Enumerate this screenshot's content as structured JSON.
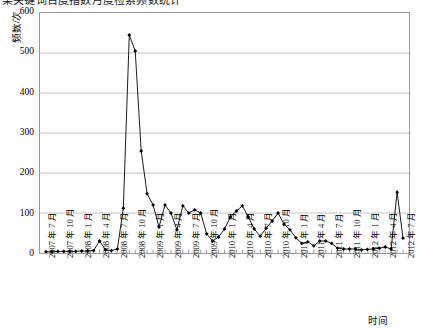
{
  "title": {
    "text": "某关键词百度指数月度检索频数统计",
    "cut_off": true,
    "legend_marker": "legend-swatch"
  },
  "axes": {
    "y_title": "频数/次",
    "x_title": "时间",
    "y_ticks": [
      600,
      500,
      400,
      300,
      200,
      100,
      0
    ],
    "y_min": 0,
    "y_max": 600,
    "x_tick_labels": [
      "2007 年 7 月",
      "2007 年 10 月",
      "2008 年 1 月",
      "2008 年 4 月",
      "2008 年 7 月",
      "2008 年 10 月",
      "2009 年 1 月",
      "2009 年 4 月",
      "2009 年 7 月",
      "2009 年 10 月",
      "2010 年 1 月",
      "2010 年 4 月",
      "2010 年 7 月",
      "2010 年 10 月",
      "2011 年 1 月",
      "2011 年 4 月",
      "2011 年 7 月",
      "2011 年 10 月",
      "2012 年 1 月",
      "2012 年 4 月",
      "2012 年 7 月"
    ]
  },
  "style": {
    "line_color": "#000000",
    "marker_color": "#000000",
    "grid_color": "#b3b3b3",
    "border_color": "#9a9a9a",
    "plot_background": "#ffffff"
  },
  "chart_data": {
    "type": "line",
    "title": "某关键词百度指数月度检索频数统计",
    "xlabel": "时间",
    "ylabel": "频数/次",
    "ylim": [
      0,
      600
    ],
    "grid": true,
    "legend": null,
    "marker": "diamond",
    "x_tick_interval_months": 3,
    "x": [
      "2007-07",
      "2007-08",
      "2007-09",
      "2007-10",
      "2007-11",
      "2007-12",
      "2008-01",
      "2008-02",
      "2008-03",
      "2008-04",
      "2008-05",
      "2008-06",
      "2008-07",
      "2008-08",
      "2008-09",
      "2008-10",
      "2008-11",
      "2008-12",
      "2009-01",
      "2009-02",
      "2009-03",
      "2009-04",
      "2009-05",
      "2009-06",
      "2009-07",
      "2009-08",
      "2009-09",
      "2009-10",
      "2009-11",
      "2009-12",
      "2010-01",
      "2010-02",
      "2010-03",
      "2010-04",
      "2010-05",
      "2010-06",
      "2010-07",
      "2010-08",
      "2010-09",
      "2010-10",
      "2010-11",
      "2010-12",
      "2011-01",
      "2011-02",
      "2011-03",
      "2011-04",
      "2011-05",
      "2011-06",
      "2011-07",
      "2011-08",
      "2011-09",
      "2011-10",
      "2011-11",
      "2011-12",
      "2012-01",
      "2012-02",
      "2012-03",
      "2012-04",
      "2012-05",
      "2012-06",
      "2012-07"
    ],
    "values": [
      3,
      3,
      4,
      4,
      4,
      4,
      5,
      5,
      6,
      30,
      8,
      6,
      10,
      112,
      545,
      505,
      255,
      148,
      120,
      65,
      120,
      100,
      58,
      118,
      100,
      108,
      100,
      48,
      30,
      40,
      60,
      90,
      105,
      118,
      90,
      60,
      42,
      62,
      80,
      100,
      72,
      58,
      38,
      24,
      28,
      18,
      30,
      30,
      24,
      12,
      10,
      10,
      10,
      8,
      9,
      10,
      12,
      15,
      10,
      152,
      37
    ]
  }
}
